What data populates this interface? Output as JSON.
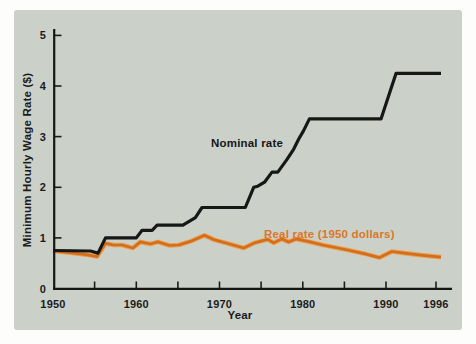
{
  "figure": {
    "background": "#fdfdfb",
    "panel_color": "#cbd1c9",
    "axis_color": "#161616"
  },
  "chart_data": {
    "type": "line",
    "title": "",
    "xlabel": "Year",
    "ylabel": "Minimum Hourly Wage Rate ($)",
    "xlim": [
      1950,
      1997
    ],
    "ylim": [
      0,
      5.2
    ],
    "grid": false,
    "legend_position": "inline-labels",
    "x_tick_marks": [
      1955,
      1960,
      1965,
      1970,
      1975,
      1980,
      1985,
      1990,
      1996
    ],
    "x_tick_labels": [
      {
        "year": 1950,
        "label": "1950"
      },
      {
        "year": 1960,
        "label": "1960"
      },
      {
        "year": 1970,
        "label": "1970"
      },
      {
        "year": 1980,
        "label": "1980"
      },
      {
        "year": 1990,
        "label": "1990"
      },
      {
        "year": 1996,
        "label": "1996"
      }
    ],
    "y_ticks": [
      {
        "value": 0,
        "label": "0"
      },
      {
        "value": 1,
        "label": "1"
      },
      {
        "value": 2,
        "label": "2"
      },
      {
        "value": 3,
        "label": "3"
      },
      {
        "value": 4,
        "label": "4"
      },
      {
        "value": 5,
        "label": "5"
      }
    ],
    "series": [
      {
        "key": "nominal-rate",
        "name": "Nominal rate",
        "color": "#171717",
        "label_color": "#171717",
        "points": [
          [
            1950,
            0.75
          ],
          [
            1954.5,
            0.74
          ],
          [
            1955.4,
            0.7
          ],
          [
            1956.3,
            1.0
          ],
          [
            1960.0,
            1.0
          ],
          [
            1960.7,
            1.15
          ],
          [
            1961.9,
            1.15
          ],
          [
            1962.5,
            1.25
          ],
          [
            1965.6,
            1.25
          ],
          [
            1967.1,
            1.4
          ],
          [
            1967.9,
            1.6
          ],
          [
            1973.1,
            1.6
          ],
          [
            1974.1,
            2.0
          ],
          [
            1974.6,
            2.02
          ],
          [
            1975.4,
            2.1
          ],
          [
            1976.3,
            2.3
          ],
          [
            1977.0,
            2.3
          ],
          [
            1978.1,
            2.55
          ],
          [
            1978.9,
            2.75
          ],
          [
            1979.5,
            2.95
          ],
          [
            1980.1,
            3.12
          ],
          [
            1980.8,
            3.35
          ],
          [
            1989.4,
            3.35
          ],
          [
            1991.2,
            4.25
          ],
          [
            1996.6,
            4.25
          ]
        ]
      },
      {
        "key": "real-rate",
        "name": "Real rate (1950 dollars)",
        "color": "#d26f1e",
        "halo_color": "#eda04f",
        "label_color": "#d9772a",
        "points": [
          [
            1950,
            0.74
          ],
          [
            1952,
            0.71
          ],
          [
            1954,
            0.67
          ],
          [
            1955.3,
            0.63
          ],
          [
            1956.3,
            0.89
          ],
          [
            1957.3,
            0.86
          ],
          [
            1958.3,
            0.86
          ],
          [
            1959.6,
            0.8
          ],
          [
            1960.5,
            0.92
          ],
          [
            1961.7,
            0.88
          ],
          [
            1962.6,
            0.92
          ],
          [
            1964.0,
            0.85
          ],
          [
            1965.1,
            0.86
          ],
          [
            1966.5,
            0.93
          ],
          [
            1968.2,
            1.05
          ],
          [
            1969.4,
            0.96
          ],
          [
            1971.2,
            0.88
          ],
          [
            1972.9,
            0.8
          ],
          [
            1974.2,
            0.9
          ],
          [
            1975.8,
            0.97
          ],
          [
            1976.5,
            0.9
          ],
          [
            1977.5,
            0.98
          ],
          [
            1978.3,
            0.92
          ],
          [
            1979.2,
            0.98
          ],
          [
            1980.6,
            0.93
          ],
          [
            1982.4,
            0.86
          ],
          [
            1985.4,
            0.76
          ],
          [
            1987.6,
            0.68
          ],
          [
            1989.2,
            0.61
          ],
          [
            1990.7,
            0.73
          ],
          [
            1992.2,
            0.7
          ],
          [
            1994.2,
            0.66
          ],
          [
            1996.6,
            0.62
          ]
        ]
      }
    ]
  }
}
